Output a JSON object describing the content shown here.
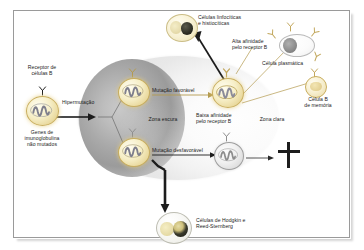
{
  "figure": {
    "background_color": "#ffffff",
    "frame_color": "#9a9a9a"
  },
  "zones": {
    "dark_zone": {
      "label": "Zona escura",
      "color": "#a9a9a9"
    },
    "light_zone": {
      "label": "Zona clara",
      "color": "#f2f2f2"
    }
  },
  "labels": {
    "b_cell_receptor": "Receptor de\ncélulas B",
    "unmutated_genes": "Genes de\nimunoglobulina\nnão mutados",
    "hypermutation": "Hipermutação",
    "favorable_mutation": "Mutação favorável",
    "unfavorable_mutation": "Mutação desfavorável",
    "dark_zone": "Zona escura",
    "light_zone": "Zona clara",
    "high_affinity": "Alta afinidade\npelo receptor B",
    "low_affinity": "Baixa afinidade\npelo receptor B",
    "lymphohistiocytic_cells": "Células linfocíticas\ne histiocíticas",
    "plasma_cell": "Célula plasmática",
    "memory_b_cell": "Célula B\nde memória",
    "hodgkin_reed_sternberg": "Células de Hodgkin e\nReed-Sternberg"
  },
  "cells": {
    "naive_b_cell": {
      "name": "naive-b-cell",
      "nucleus_color": "#8c8c8c",
      "body_color": "#f6eec6"
    },
    "favorable_b_cell": {
      "name": "favorable-mutant-b-cell",
      "body_color": "#f6eec6"
    },
    "unfavorable_b_cell": {
      "name": "unfavorable-mutant-b-cell",
      "body_color": "#f0f0f0"
    },
    "selected_b_cell": {
      "name": "high-affinity-b-cell",
      "body_color": "#f6eec6"
    },
    "low_affinity_b_cell": {
      "name": "low-affinity-b-cell",
      "body_color": "#f0f0f0"
    },
    "plasma_cell": {
      "name": "plasma-cell",
      "nucleus_color": "#8e8e8e"
    },
    "memory_cell": {
      "name": "memory-b-cell",
      "body_color": "#f7efd0"
    },
    "popcorn_cell": {
      "name": "lymphohistiocytic-cell",
      "nucleus_color": "#2e2e24"
    },
    "hrs_cell": {
      "name": "reed-sternberg-cell",
      "nucleus_color": "#141410"
    }
  },
  "symbols": {
    "apoptosis": {
      "name": "apoptosis-cross",
      "color": "#1d1d1d"
    },
    "receptor": {
      "name": "y-shaped-receptor",
      "color": "#c9ae5e"
    }
  }
}
